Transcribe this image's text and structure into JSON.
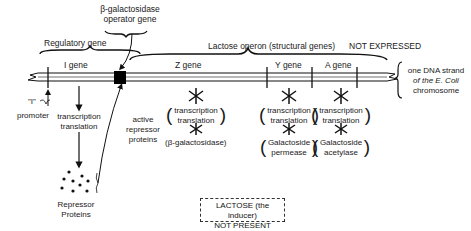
{
  "title_labels": {
    "operator": [
      "β-galactosidase",
      "operator gene"
    ],
    "regulatory": "Regulatory gene",
    "operon": "Lactose operon (structural genes)",
    "not_expressed": "NOT EXPRESSED"
  },
  "genes": {
    "i": "I gene",
    "z": "Z gene",
    "y": "Y gene",
    "a": "A gene"
  },
  "dna_label": [
    "one DNA strand",
    "of the E. Coli",
    "chromosome"
  ],
  "promoter": {
    "mark": "\"I\"",
    "label": "promoter"
  },
  "i_path": {
    "process": [
      "transcription",
      "translation"
    ],
    "product": [
      "Repressor",
      "Proteins"
    ]
  },
  "repressor_label": [
    "active",
    "repressor",
    "proteins"
  ],
  "z_path": {
    "process": [
      "transcription",
      "translation"
    ],
    "product": "(β-galactosidase)"
  },
  "y_path": {
    "process": [
      "transcription",
      "translation"
    ],
    "product": [
      "Galactoside",
      "permease"
    ]
  },
  "a_path": {
    "process": [
      "transcription",
      "translation"
    ],
    "product": [
      "Galactoside",
      "acetylase"
    ]
  },
  "inducer_box": [
    "LACTOSE (the inducer)",
    "NOT PRESENT"
  ]
}
